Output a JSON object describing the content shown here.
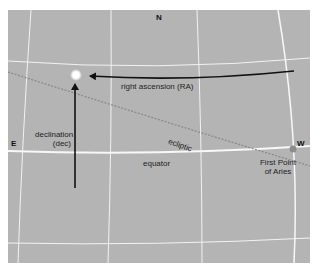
{
  "diagram": {
    "cardinals": {
      "north": "N",
      "east": "E",
      "west": "W"
    },
    "labels": {
      "ra": "right ascension (RA)",
      "dec_line1": "declination",
      "dec_line2": "(dec)",
      "ecliptic": "ecliptic",
      "equator": "equator",
      "aries_line1": "First Point",
      "aries_line2": "of Aries"
    },
    "colors": {
      "sky": "#b4b4b4",
      "grid": "#f2f2f2",
      "arrow": "#111111",
      "ecliptic": "#8a8a8a",
      "star": "#ffffff",
      "aries_marker": "#8c8c8c"
    }
  }
}
